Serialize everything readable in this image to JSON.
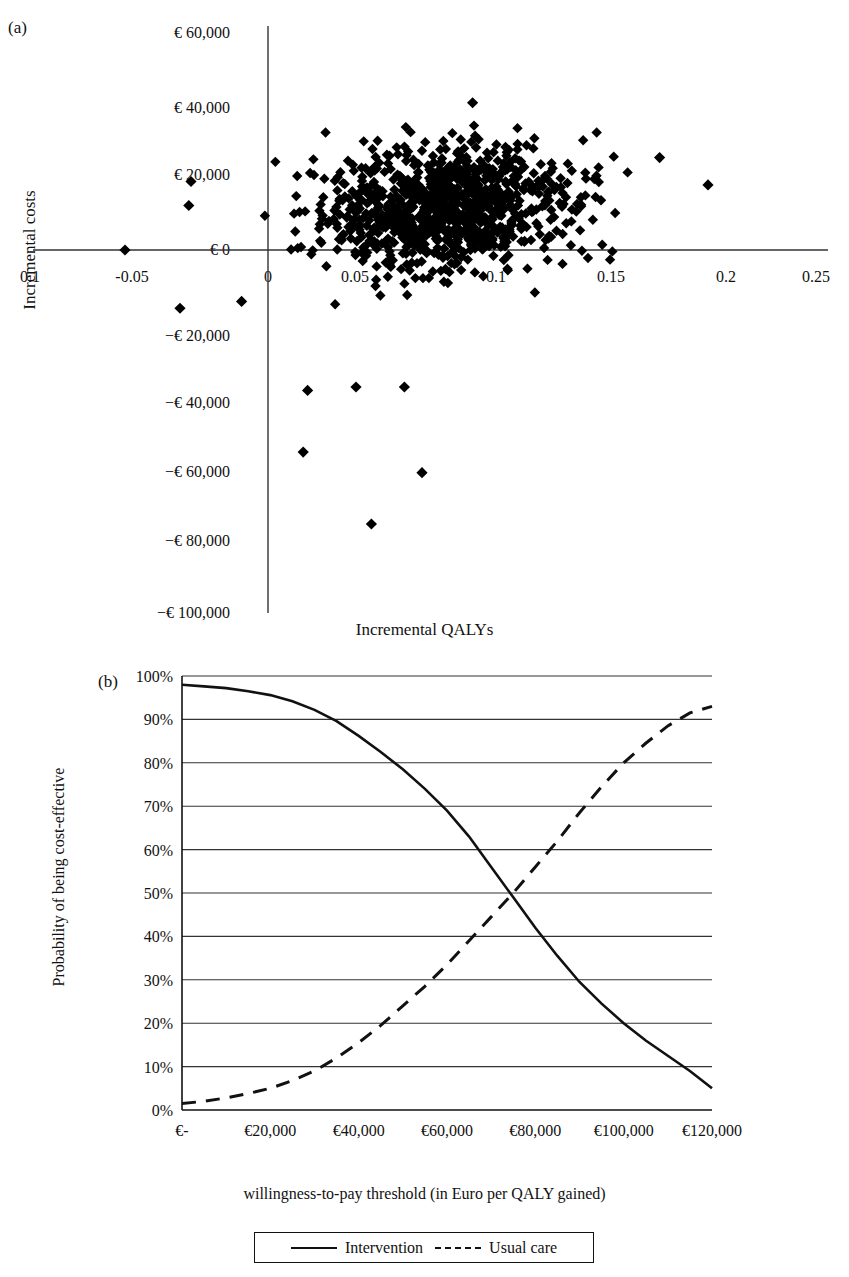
{
  "figure": {
    "panel_a_letter": "(a)",
    "panel_b_letter": "(b)"
  },
  "chart_data": [
    {
      "id": "cost-effectiveness-plane",
      "type": "scatter",
      "panel": "(a)",
      "title": "",
      "xlabel": "Incremental QALYs",
      "ylabel": "Incremental costs",
      "xlim": [
        -0.125,
        0.275
      ],
      "ylim": [
        -100000,
        60000
      ],
      "grid": false,
      "legend": "none",
      "marker": "diamond",
      "marker_color": "#000000",
      "xticks": [
        -0.1,
        -0.05,
        0,
        0.05,
        0.1,
        0.15,
        0.2,
        0.25
      ],
      "xticklabels": [
        "0.1",
        "-0.05",
        "0",
        "0.05",
        "0.1",
        "0.15",
        "0.2",
        "0.25"
      ],
      "yticks": [
        60000,
        40000,
        20000,
        0,
        -20000,
        -40000,
        -60000,
        -80000,
        -100000
      ],
      "yticklabels": [
        "€ 60,000",
        "€ 40,000",
        "€ 20,000",
        "€ 0",
        "−€ 20,000",
        "−€ 40,000",
        "−€ 60,000",
        "−€ 80,000",
        "−€ 100,000"
      ],
      "cloud": {
        "description": "Dense bootstrap cloud of incremental cost-effectiveness pairs centred in the north-east quadrant",
        "n_points": 1000,
        "center_x": 0.082,
        "center_y": 12000,
        "sd_x": 0.027,
        "sd_y": 9000,
        "correlation": 0.15
      },
      "notable_points": [
        {
          "x": -0.065,
          "y": 0
        },
        {
          "x": -0.035,
          "y": 20000
        },
        {
          "x": -0.036,
          "y": 13000
        },
        {
          "x": -0.04,
          "y": -17000
        },
        {
          "x": -0.012,
          "y": -15000
        },
        {
          "x": 0.093,
          "y": 43000
        },
        {
          "x": 0.178,
          "y": 27000
        },
        {
          "x": 0.2,
          "y": 19000
        },
        {
          "x": 0.018,
          "y": -41000
        },
        {
          "x": 0.04,
          "y": -40000
        },
        {
          "x": 0.062,
          "y": -40000
        },
        {
          "x": 0.016,
          "y": -59000
        },
        {
          "x": 0.07,
          "y": -65000
        },
        {
          "x": 0.047,
          "y": -80000
        }
      ]
    },
    {
      "id": "ceac",
      "type": "line",
      "panel": "(b)",
      "title": "",
      "xlabel": "willingness-to-pay threshold (in Euro per QALY gained)",
      "ylabel": "Probability of being cost-effective",
      "xlim": [
        0,
        120000
      ],
      "ylim": [
        0,
        1
      ],
      "grid": true,
      "grid_axis": "y",
      "legend_position": "bottom",
      "xticks": [
        0,
        20000,
        40000,
        60000,
        80000,
        100000,
        120000
      ],
      "xticklabels": [
        "€-",
        "€20,000",
        "€40,000",
        "€60,000",
        "€80,000",
        "€100,000",
        "€120,000"
      ],
      "yticks": [
        0,
        10,
        20,
        30,
        40,
        50,
        60,
        70,
        80,
        90,
        100
      ],
      "yticklabels": [
        "0%",
        "10%",
        "20%",
        "30%",
        "40%",
        "50%",
        "60%",
        "70%",
        "80%",
        "90%",
        "100%"
      ],
      "x": [
        0,
        5000,
        10000,
        15000,
        20000,
        25000,
        30000,
        35000,
        40000,
        45000,
        50000,
        55000,
        60000,
        65000,
        70000,
        75000,
        80000,
        85000,
        90000,
        95000,
        100000,
        105000,
        110000,
        115000,
        120000
      ],
      "series": [
        {
          "name": "Intervention",
          "style": "solid",
          "color": "#111111",
          "values": [
            98,
            97.6,
            97.2,
            96.5,
            95.6,
            94.2,
            92.2,
            89.6,
            86.2,
            82.5,
            78.5,
            74.0,
            69.0,
            63.0,
            56.0,
            49.0,
            42.0,
            35.5,
            29.5,
            24.5,
            20.0,
            16.0,
            12.5,
            9.0,
            5.0
          ]
        },
        {
          "name": "Usual care",
          "style": "dashed",
          "color": "#111111",
          "values": [
            1.5,
            2.0,
            2.8,
            3.8,
            5.0,
            6.8,
            9.0,
            12.0,
            15.5,
            19.5,
            24.0,
            28.5,
            33.5,
            39.0,
            44.5,
            50.0,
            56.0,
            62.0,
            68.5,
            74.5,
            80.0,
            84.5,
            88.5,
            91.5,
            93.0
          ]
        }
      ]
    }
  ],
  "legend": {
    "entries": [
      {
        "label": "Intervention",
        "style": "solid"
      },
      {
        "label": "Usual care",
        "style": "dashed"
      }
    ]
  }
}
